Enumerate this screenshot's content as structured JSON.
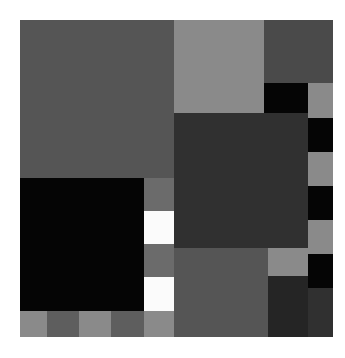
{
  "image": {
    "title": "Abstract Grayscale Mosaic",
    "kind": "rectangular-block-composition",
    "canvas": {
      "width": 345,
      "height": 358,
      "background": "#ffffff"
    },
    "content_area": {
      "x": 20,
      "y": 20,
      "width": 313,
      "height": 317
    },
    "palette": {
      "black": "#050505",
      "near_black": "#252525",
      "dark_gray": "#303030",
      "mid_dark_gray": "#4a4a4a",
      "mid_gray": "#555555",
      "gray": "#5e5e5e",
      "warm_gray": "#6b6b6b",
      "light_gray": "#8a8a8a",
      "pale_gray": "#9a9a9a",
      "white": "#fbfbfb"
    },
    "tiles": [
      {
        "name": "top-left-large-block",
        "x": 0,
        "y": 0,
        "w": 154,
        "h": 158,
        "color": "#555555"
      },
      {
        "name": "top-center-light-block",
        "x": 154,
        "y": 0,
        "w": 90,
        "h": 93,
        "color": "#8a8a8a"
      },
      {
        "name": "top-right-dark-block",
        "x": 244,
        "y": 0,
        "w": 44,
        "h": 63,
        "color": "#4a4a4a"
      },
      {
        "name": "top-far-right-dark-strip",
        "x": 288,
        "y": 0,
        "w": 25,
        "h": 63,
        "color": "#4a4a4a"
      },
      {
        "name": "upper-right-black-square",
        "x": 244,
        "y": 63,
        "w": 44,
        "h": 35,
        "color": "#050505"
      },
      {
        "name": "upper-far-right-light-square",
        "x": 288,
        "y": 63,
        "w": 25,
        "h": 35,
        "color": "#8a8a8a"
      },
      {
        "name": "center-dark-large-block",
        "x": 154,
        "y": 93,
        "w": 134,
        "h": 135,
        "color": "#303030"
      },
      {
        "name": "right-black-square-a",
        "x": 288,
        "y": 98,
        "w": 25,
        "h": 34,
        "color": "#050505"
      },
      {
        "name": "right-light-square-a",
        "x": 288,
        "y": 132,
        "w": 25,
        "h": 34,
        "color": "#8a8a8a"
      },
      {
        "name": "right-black-square-b",
        "x": 288,
        "y": 166,
        "w": 25,
        "h": 34,
        "color": "#050505"
      },
      {
        "name": "right-light-square-b",
        "x": 288,
        "y": 200,
        "w": 25,
        "h": 34,
        "color": "#8a8a8a"
      },
      {
        "name": "right-black-square-c",
        "x": 288,
        "y": 234,
        "w": 25,
        "h": 34,
        "color": "#050505"
      },
      {
        "name": "bottom-right-dark-block",
        "x": 288,
        "y": 268,
        "w": 25,
        "h": 49,
        "color": "#303030"
      },
      {
        "name": "left-black-large-block",
        "x": 0,
        "y": 158,
        "w": 124,
        "h": 133,
        "color": "#050505"
      },
      {
        "name": "checker-gray-1",
        "x": 124,
        "y": 158,
        "w": 30,
        "h": 33,
        "color": "#6b6b6b"
      },
      {
        "name": "checker-white-1",
        "x": 124,
        "y": 191,
        "w": 30,
        "h": 33,
        "color": "#fbfbfb"
      },
      {
        "name": "checker-gray-2",
        "x": 124,
        "y": 224,
        "w": 30,
        "h": 33,
        "color": "#6b6b6b"
      },
      {
        "name": "checker-white-2",
        "x": 124,
        "y": 257,
        "w": 30,
        "h": 34,
        "color": "#fbfbfb"
      },
      {
        "name": "center-bottom-mid-block",
        "x": 154,
        "y": 228,
        "w": 114,
        "h": 89,
        "color": "#555555"
      },
      {
        "name": "bottom-right-light-square",
        "x": 248,
        "y": 228,
        "w": 40,
        "h": 28,
        "color": "#8a8a8a"
      },
      {
        "name": "bottom-right-near-black-block",
        "x": 248,
        "y": 256,
        "w": 40,
        "h": 61,
        "color": "#252525"
      },
      {
        "name": "bottom-row-cell-1",
        "x": 0,
        "y": 291,
        "w": 27,
        "h": 26,
        "color": "#8a8a8a"
      },
      {
        "name": "bottom-row-cell-2",
        "x": 27,
        "y": 291,
        "w": 32,
        "h": 26,
        "color": "#5e5e5e"
      },
      {
        "name": "bottom-row-cell-3",
        "x": 59,
        "y": 291,
        "w": 32,
        "h": 26,
        "color": "#8a8a8a"
      },
      {
        "name": "bottom-row-cell-4",
        "x": 91,
        "y": 291,
        "w": 33,
        "h": 26,
        "color": "#5e5e5e"
      },
      {
        "name": "bottom-row-cell-5",
        "x": 124,
        "y": 291,
        "w": 30,
        "h": 26,
        "color": "#8a8a8a"
      }
    ]
  }
}
